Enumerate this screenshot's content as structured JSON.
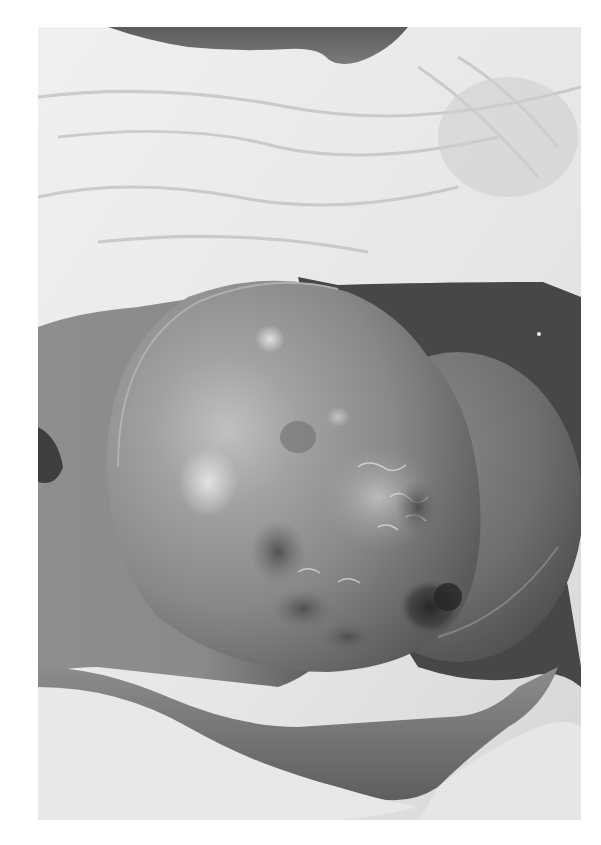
{
  "figure": {
    "type": "grayscale clinical photograph",
    "border_color": "#ffffff",
    "frame": {
      "x": 38,
      "y": 27,
      "width": 543,
      "height": 793
    }
  },
  "palette": {
    "sheet_light": "#ececec",
    "sheet_shadow": "#c9c9c9",
    "skin_mid": "#8c8c8c",
    "skin_dark": "#5a5a5a",
    "mass_highlight": "#c4c4c4",
    "mass_base": "#8a8a8a",
    "mass_shadow": "#5e5e5e",
    "ulcer_dark": "#2e2e2e",
    "background_dark": "#454545"
  }
}
